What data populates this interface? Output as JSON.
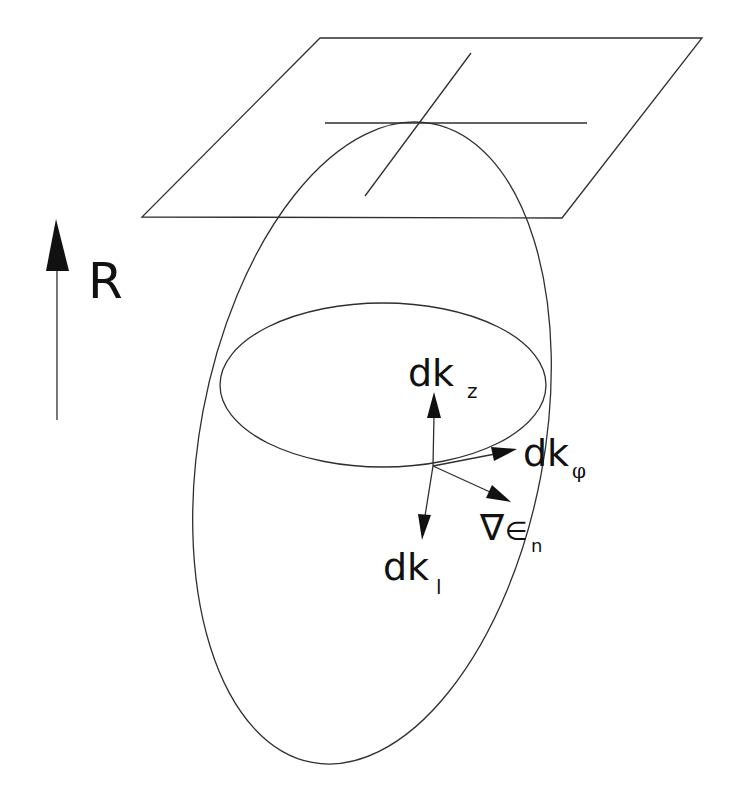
{
  "diagram": {
    "background": "#ffffff",
    "line_color": "#2f2f2f",
    "direction_indicator": {
      "label": "R",
      "arrow": "up"
    },
    "tangent_plane": {
      "corners": [
        [
          320,
          38
        ],
        [
          702,
          38
        ],
        [
          562,
          218
        ],
        [
          142,
          217
        ]
      ],
      "cross_lines": [
        [
          [
            325,
            123
          ],
          [
            587,
            123
          ]
        ],
        [
          [
            471,
            53
          ],
          [
            365,
            196
          ]
        ]
      ]
    },
    "fermi_surface_ellipse": {
      "cx": 372,
      "cy": 443,
      "rx": 172,
      "ry": 325,
      "rotation_deg": 10.6
    },
    "cross_section_ellipse": {
      "cx": 383,
      "cy": 385,
      "rx": 163,
      "ry": 82
    },
    "vectors": [
      {
        "name": "dk_z",
        "label_main": "dk",
        "label_sub": "z"
      },
      {
        "name": "dk_phi",
        "label_main": "dk",
        "label_sub": "φ"
      },
      {
        "name": "grad_eps",
        "label_nabla": "∇",
        "label_main": "∈",
        "label_sub": "n"
      },
      {
        "name": "dk_l",
        "label_main": "dk",
        "label_sub": "l"
      }
    ]
  }
}
